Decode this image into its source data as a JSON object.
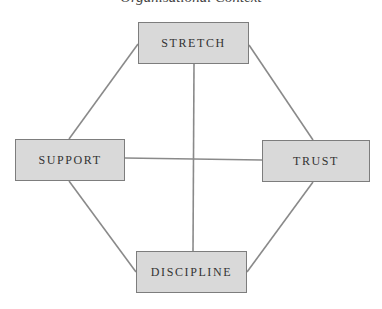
{
  "diagram": {
    "title": "Organisational Context",
    "nodes": {
      "stretch": "STRETCH",
      "support": "SUPPORT",
      "trust": "TRUST",
      "discipline": "DISCIPLINE"
    },
    "edges": [
      [
        "STRETCH",
        "SUPPORT"
      ],
      [
        "STRETCH",
        "TRUST"
      ],
      [
        "STRETCH",
        "DISCIPLINE"
      ],
      [
        "SUPPORT",
        "TRUST"
      ],
      [
        "SUPPORT",
        "DISCIPLINE"
      ],
      [
        "TRUST",
        "DISCIPLINE"
      ]
    ],
    "colors": {
      "node_fill": "#d9d9d9",
      "node_border": "#7d7d7d",
      "edge": "#8a8a8a",
      "text": "#333333"
    }
  }
}
